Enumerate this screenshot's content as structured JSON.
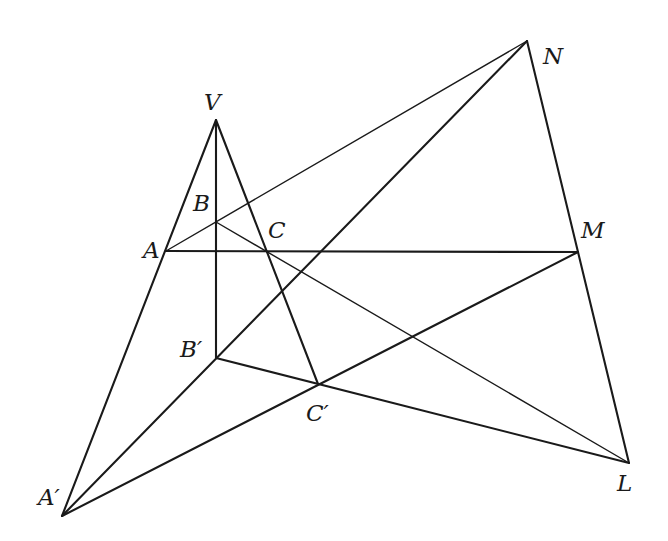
{
  "diagram": {
    "type": "geometry-desargues-configuration",
    "points": {
      "V": {
        "label": "V",
        "x": 216,
        "y": 120,
        "lx": 204,
        "ly": 110
      },
      "A": {
        "label": "A",
        "x": 166,
        "y": 251,
        "lx": 143,
        "ly": 258
      },
      "B": {
        "label": "B",
        "x": 216,
        "y": 222,
        "lx": 193,
        "ly": 211
      },
      "C": {
        "label": "C",
        "x": 268,
        "y": 251,
        "lx": 268,
        "ly": 238
      },
      "A'": {
        "label": "A′",
        "x": 62,
        "y": 516,
        "lx": 38,
        "ly": 505
      },
      "B'": {
        "label": "B′",
        "x": 216,
        "y": 358,
        "lx": 180,
        "ly": 357
      },
      "C'": {
        "label": "C′",
        "x": 318,
        "y": 384,
        "lx": 306,
        "ly": 421
      },
      "L": {
        "label": "L",
        "x": 629,
        "y": 463,
        "lx": 617,
        "ly": 491
      },
      "M": {
        "label": "M",
        "x": 578,
        "y": 252,
        "lx": 581,
        "ly": 238
      },
      "N": {
        "label": "N",
        "x": 527,
        "y": 41,
        "lx": 543,
        "ly": 64
      }
    },
    "segments": [
      {
        "from": "V",
        "to": "A'",
        "weight": "thick"
      },
      {
        "from": "V",
        "to": "B'",
        "weight": "thick"
      },
      {
        "from": "V",
        "to": "C'",
        "weight": "thick"
      },
      {
        "from": "A",
        "to": "M",
        "weight": "thick"
      },
      {
        "from": "A",
        "to": "N",
        "weight": "thin"
      },
      {
        "from": "B",
        "to": "L",
        "weight": "thin"
      },
      {
        "from": "N",
        "to": "L",
        "weight": "thick"
      },
      {
        "from": "A'",
        "to": "N",
        "weight": "thick"
      },
      {
        "from": "A'",
        "to": "M",
        "weight": "thick"
      },
      {
        "from": "B'",
        "to": "L",
        "weight": "thick"
      }
    ]
  }
}
